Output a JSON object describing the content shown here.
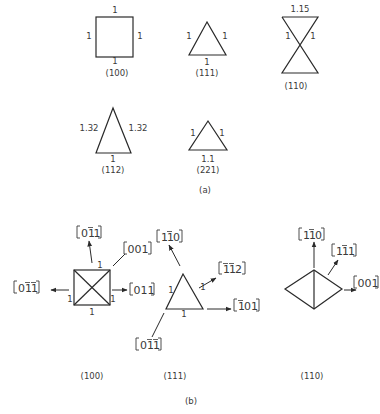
{
  "part_a": {
    "caption": "(a)",
    "shapes": [
      {
        "name": "square-100",
        "plane": "(100)",
        "edges": {
          "top": "1",
          "left": "1",
          "right": "1",
          "bottom": "1"
        }
      },
      {
        "name": "triangle-111",
        "plane": "(111)",
        "edges": {
          "left": "1",
          "right": "1",
          "bottom": "1"
        }
      },
      {
        "name": "hourglass-110",
        "plane": "(110)",
        "edges": {
          "top": "1.15",
          "left": "1",
          "right": "1"
        }
      },
      {
        "name": "triangle-112",
        "plane": "(112)",
        "edges": {
          "left": "1.32",
          "right": "1.32",
          "bottom": "1"
        }
      },
      {
        "name": "triangle-221",
        "plane": "(221)",
        "edges": {
          "left": "1",
          "right": "1",
          "bottom": "1.1"
        }
      }
    ]
  },
  "part_b": {
    "caption": "(b)",
    "groups": [
      {
        "plane": "(100)",
        "edge_label": "1",
        "directions": [
          {
            "digits": [
              "0",
              "1",
              "1"
            ],
            "bars": [
              false,
              true,
              false
            ],
            "display": "[01̄1]"
          },
          {
            "digits": [
              "0",
              "0",
              "1"
            ],
            "bars": [
              false,
              false,
              false
            ],
            "display": "[001]"
          },
          {
            "digits": [
              "0",
              "1",
              "1"
            ],
            "bars": [
              false,
              true,
              true
            ],
            "display": "[01̄1̄]"
          },
          {
            "digits": [
              "0",
              "1",
              "1"
            ],
            "bars": [
              false,
              false,
              false
            ],
            "display": "[011]"
          }
        ]
      },
      {
        "plane": "(111)",
        "edge_label": "1",
        "directions": [
          {
            "digits": [
              "1",
              "1",
              "0"
            ],
            "bars": [
              false,
              true,
              false
            ],
            "display": "[11̄0]"
          },
          {
            "digits": [
              "1",
              "1",
              "2"
            ],
            "bars": [
              true,
              true,
              false
            ],
            "display": "[1̄1̄2]"
          },
          {
            "digits": [
              "1",
              "0",
              "1"
            ],
            "bars": [
              true,
              false,
              false
            ],
            "display": "[1̄01]"
          },
          {
            "digits": [
              "0",
              "1",
              "1"
            ],
            "bars": [
              false,
              true,
              true
            ],
            "display": "[01̄1̄]"
          }
        ]
      },
      {
        "plane": "(110)",
        "directions": [
          {
            "digits": [
              "1",
              "1",
              "0"
            ],
            "bars": [
              false,
              true,
              false
            ],
            "display": "[11̄0]"
          },
          {
            "digits": [
              "1",
              "1",
              "1"
            ],
            "bars": [
              false,
              true,
              false
            ],
            "display": "[11̄1]"
          },
          {
            "digits": [
              "0",
              "0",
              "1"
            ],
            "bars": [
              false,
              false,
              false
            ],
            "display": "[001]"
          }
        ]
      }
    ]
  }
}
